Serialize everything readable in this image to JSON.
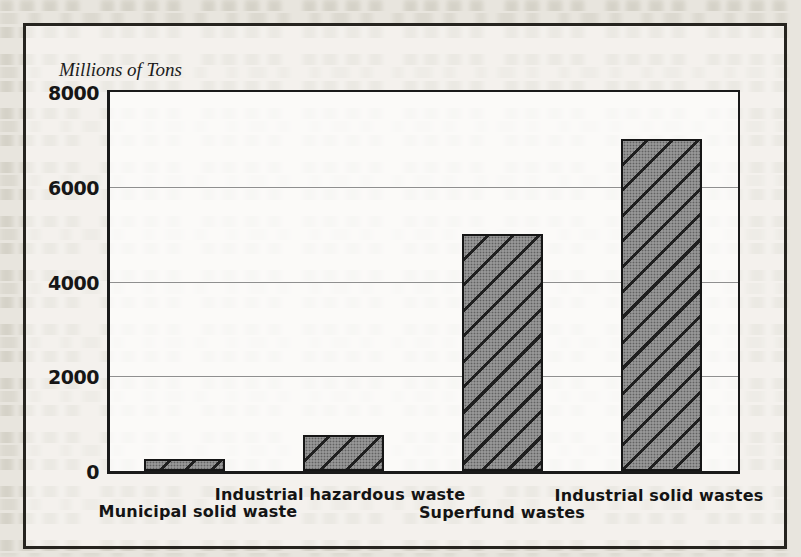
{
  "figure": {
    "axis_title": "Millions of Tons"
  },
  "chart_data": {
    "type": "bar",
    "title": "Millions of Tons",
    "ylabel": "Millions of Tons",
    "xlabel": "",
    "categories": [
      "Municipal solid waste",
      "Industrial hazardous waste",
      "Superfund wastes",
      "Industrial solid wastes"
    ],
    "values": [
      250,
      750,
      5000,
      7000
    ],
    "ylim": [
      0,
      8000
    ],
    "yticks": [
      0,
      2000,
      4000,
      6000,
      8000
    ],
    "grid": true,
    "legend": false,
    "bar_style": "gray halftone fill with forward diagonal hatch",
    "ink_color": "#1a1a1a",
    "bar_fill_color": "#969696",
    "paper_color": "#e8e5de"
  }
}
